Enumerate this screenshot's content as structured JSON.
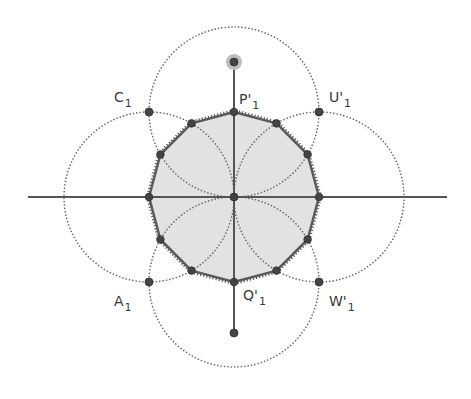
{
  "diagram": {
    "title": "",
    "colors": {
      "background": "#ffffff",
      "polygon_fill": "#e2e2e2",
      "polygon_stroke": "#5a5a5a",
      "axis_line": "#555555",
      "dotted_circle": "#666666",
      "point": "#444444",
      "selected_halo": "#bdbdbd",
      "label": "#3a3a3a"
    },
    "center": {
      "x": 234,
      "y": 197
    },
    "radius": 85,
    "axes": {
      "horizontal": {
        "x1": 28,
        "y1": 197,
        "x2": 447,
        "y2": 197
      },
      "vertical": {
        "x1": 234,
        "y1": 62,
        "x2": 234,
        "y2": 333
      }
    },
    "circles": [
      {
        "name": "top-circle",
        "cx": 234,
        "cy": 112,
        "r": 85
      },
      {
        "name": "bottom-circle",
        "cx": 234,
        "cy": 282,
        "r": 85
      },
      {
        "name": "left-circle",
        "cx": 149,
        "cy": 197,
        "r": 85
      },
      {
        "name": "right-circle",
        "cx": 319,
        "cy": 197,
        "r": 85
      }
    ],
    "polygon_vertices": [
      [
        234,
        112
      ],
      [
        276.5,
        123.4
      ],
      [
        307.6,
        154.5
      ],
      [
        319,
        197
      ],
      [
        307.6,
        239.5
      ],
      [
        276.5,
        270.6
      ],
      [
        234,
        282
      ],
      [
        191.5,
        270.6
      ],
      [
        160.4,
        239.5
      ],
      [
        149,
        197
      ],
      [
        160.4,
        154.5
      ],
      [
        191.5,
        123.4
      ]
    ],
    "extra_points": [
      {
        "name": "top-handle-point",
        "x": 234,
        "y": 62,
        "selected": true
      },
      {
        "name": "bottom-point",
        "x": 234,
        "y": 333,
        "selected": false
      },
      {
        "name": "center-point",
        "x": 234,
        "y": 197,
        "selected": false
      },
      {
        "name": "point-C1",
        "x": 149,
        "y": 112,
        "selected": false
      },
      {
        "name": "point-U1",
        "x": 319,
        "y": 112,
        "selected": false
      },
      {
        "name": "point-A1",
        "x": 149,
        "y": 282,
        "selected": false
      },
      {
        "name": "point-W1",
        "x": 319,
        "y": 282,
        "selected": false
      }
    ],
    "labels": [
      {
        "name": "label-C1",
        "main": "C",
        "sub": "1",
        "x": 114,
        "y": 102
      },
      {
        "name": "label-P1",
        "main": "P'",
        "sub": "1",
        "x": 239,
        "y": 104
      },
      {
        "name": "label-U1",
        "main": "U'",
        "sub": "1",
        "x": 329,
        "y": 102
      },
      {
        "name": "label-A1",
        "main": "A",
        "sub": "1",
        "x": 114,
        "y": 306
      },
      {
        "name": "label-Q1",
        "main": "Q'",
        "sub": "1",
        "x": 243,
        "y": 300
      },
      {
        "name": "label-W1",
        "main": "W'",
        "sub": "1",
        "x": 329,
        "y": 306
      }
    ]
  }
}
